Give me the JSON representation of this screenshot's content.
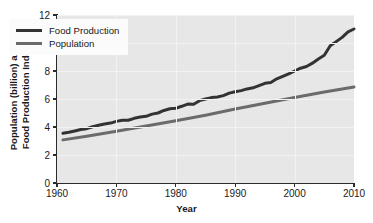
{
  "chart_data": {
    "type": "line",
    "title": "",
    "xlabel": "Year",
    "ylabel_line1": "Population (billion) and",
    "ylabel_line2": "Food Production Index",
    "xlim": [
      1960,
      2010
    ],
    "ylim": [
      0,
      12
    ],
    "xticks": [
      1960,
      1970,
      1980,
      1990,
      2000,
      2010
    ],
    "yticks": [
      0,
      2,
      4,
      6,
      8,
      10,
      12
    ],
    "grid": true,
    "legend_position": "upper left",
    "plot_bgcolor": "#e7e7e7",
    "gridcolor": "#f2f2f2",
    "axiscolor": "#2b2b2b",
    "series": [
      {
        "name": "Food Production",
        "color": "#333333",
        "linewidth": 3.0,
        "x": [
          1961,
          1962,
          1963,
          1964,
          1965,
          1966,
          1967,
          1968,
          1969,
          1970,
          1971,
          1972,
          1973,
          1974,
          1975,
          1976,
          1977,
          1978,
          1979,
          1980,
          1981,
          1982,
          1983,
          1984,
          1985,
          1986,
          1987,
          1988,
          1989,
          1990,
          1991,
          1992,
          1993,
          1994,
          1995,
          1996,
          1997,
          1998,
          1999,
          2000,
          2001,
          2002,
          2003,
          2004,
          2005,
          2006,
          2007,
          2008,
          2009,
          2010
        ],
        "values": [
          3.55,
          3.62,
          3.72,
          3.82,
          3.88,
          4.02,
          4.12,
          4.22,
          4.28,
          4.4,
          4.48,
          4.48,
          4.62,
          4.72,
          4.76,
          4.92,
          5.0,
          5.18,
          5.3,
          5.34,
          5.48,
          5.64,
          5.62,
          5.88,
          6.0,
          6.1,
          6.14,
          6.24,
          6.42,
          6.52,
          6.6,
          6.72,
          6.8,
          6.96,
          7.12,
          7.18,
          7.44,
          7.62,
          7.8,
          8.0,
          8.2,
          8.32,
          8.56,
          8.86,
          9.12,
          9.8,
          10.1,
          10.4,
          10.8,
          11.0
        ]
      },
      {
        "name": "Population",
        "color": "#6b6b6b",
        "linewidth": 3.0,
        "x": [
          1961,
          1965,
          1970,
          1975,
          1980,
          1985,
          1990,
          1995,
          2000,
          2005,
          2010
        ],
        "values": [
          3.08,
          3.34,
          3.7,
          4.07,
          4.44,
          4.84,
          5.28,
          5.7,
          6.11,
          6.5,
          6.85
        ]
      }
    ]
  },
  "legend": {
    "items": [
      {
        "label": "Food Production",
        "color": "#333333"
      },
      {
        "label": "Population",
        "color": "#6b6b6b"
      }
    ]
  },
  "axes": {
    "x_title": "Year",
    "y_title_line1": "Population (billion) and",
    "y_title_line2": "Food Production Index",
    "x_tick_labels": [
      "1960",
      "1970",
      "1980",
      "1990",
      "2000",
      "2010"
    ],
    "y_tick_labels": [
      "0",
      "2",
      "4",
      "6",
      "8",
      "10",
      "12"
    ]
  }
}
